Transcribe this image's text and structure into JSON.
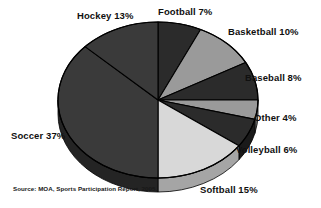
{
  "figure": {
    "background_color": "#ffffff",
    "source_note": "Source: MOA, Sports Participation Report, 2005."
  },
  "labels": {
    "hockey": "Hockey 13%",
    "football": "Football 7%",
    "basketball": "Basketball 10%",
    "baseball": "Baseball 8%",
    "other": "Other 4%",
    "volleyball": "Volleyball 6%",
    "softball": "Softball 15%",
    "soccer": "Soccer 37%"
  },
  "chart_data": {
    "type": "pie",
    "title": "",
    "subtitle": "",
    "xlabel": "",
    "ylabel": "",
    "legend_position": "none",
    "labels_position": "outside-callout",
    "grid": false,
    "three_d": true,
    "start_angle_deg": 90,
    "direction": "clockwise",
    "units": "percent",
    "total": 100,
    "annotations": [
      "Source: MOA, Sports Participation Report, 2005."
    ],
    "categories": [
      "Football",
      "Basketball",
      "Baseball",
      "Other",
      "Volleyball",
      "Softball",
      "Soccer",
      "Hockey"
    ],
    "values": [
      7,
      10,
      8,
      4,
      6,
      15,
      37,
      13
    ],
    "slices": [
      {
        "name": "Football",
        "value": 7,
        "label": "Football 7%",
        "color": "#2b2b2b",
        "side_color": "#1a1a1a"
      },
      {
        "name": "Basketball",
        "value": 10,
        "label": "Basketball 10%",
        "color": "#9a9a9a",
        "side_color": "#6e6e6e"
      },
      {
        "name": "Baseball",
        "value": 8,
        "label": "Baseball 8%",
        "color": "#2b2b2b",
        "side_color": "#1a1a1a"
      },
      {
        "name": "Other",
        "value": 4,
        "label": "Other 4%",
        "color": "#9a9a9a",
        "side_color": "#6e6e6e"
      },
      {
        "name": "Volleyball",
        "value": 6,
        "label": "Volleyball 6%",
        "color": "#2b2b2b",
        "side_color": "#1a1a1a"
      },
      {
        "name": "Softball",
        "value": 15,
        "label": "Softball 15%",
        "color": "#d8d8d8",
        "side_color": "#a5a5a5"
      },
      {
        "name": "Soccer",
        "value": 37,
        "label": "Soccer 37%",
        "color": "#3a3a3a",
        "side_color": "#242424"
      },
      {
        "name": "Hockey",
        "value": 13,
        "label": "Hockey 13%",
        "color": "#3a3a3a",
        "side_color": "#242424"
      }
    ]
  }
}
